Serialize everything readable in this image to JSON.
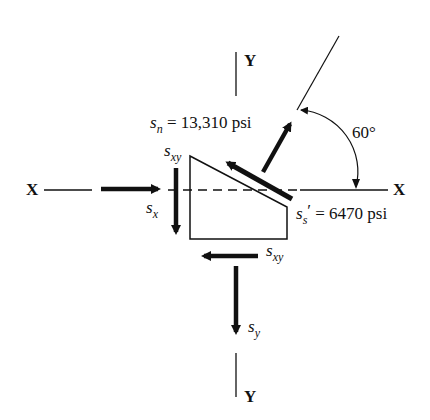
{
  "diagram": {
    "axes": {
      "x_left": "X",
      "x_right": "X",
      "y_top": "Y",
      "y_bottom": "Y"
    },
    "angle": {
      "label": "60°",
      "value_deg": 60
    },
    "stresses": {
      "normal": {
        "symbol": "s",
        "subscript": "n",
        "equals": "=",
        "value": "13,310 psi"
      },
      "shear_inclined": {
        "symbol": "s",
        "subscript": "s",
        "prime": "′",
        "equals": "=",
        "value": "6470 psi"
      },
      "sx": {
        "symbol": "s",
        "subscript": "x"
      },
      "sy": {
        "symbol": "s",
        "subscript": "y"
      },
      "sxy_left": {
        "symbol": "s",
        "subscript": "xy"
      },
      "sxy_bottom": {
        "symbol": "s",
        "subscript": "xy"
      }
    },
    "colors": {
      "ink": "#111111",
      "background": "#ffffff"
    }
  }
}
